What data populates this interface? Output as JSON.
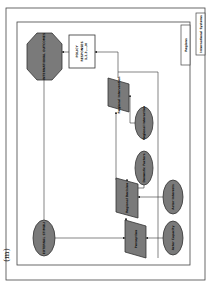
{
  "panel_label": "(m)",
  "frames": {
    "outer_label": "International Systems",
    "inner_label": "Regions"
  },
  "nodes": {
    "octagon": {
      "label": "INTERNATIONAL OUTCOMES"
    },
    "policy_box": {
      "label_line1": "POLICY",
      "label_line2": "RESPONSES",
      "label_line3": "1,2,3,...,N"
    },
    "para_top": {
      "label": "Regional Intervention"
    },
    "ellipse_a": {
      "label": "Regional Interaction"
    },
    "ellipse_b": {
      "label": "Domestic Factors"
    },
    "para_mid": {
      "label": "Regional Decision"
    },
    "ellipse_c": {
      "label": "Actor Interests"
    },
    "para_low": {
      "label": "Perception"
    },
    "ellipse_d": {
      "label": "Actor Capacity"
    },
    "ellipse_left": {
      "label": "EXTERNAL STIMULI"
    }
  },
  "colors": {
    "shape_fill": "#7a7a7a",
    "shape_stroke": "#333333",
    "frame_stroke": "#444444",
    "box_fill": "#ffffff"
  }
}
